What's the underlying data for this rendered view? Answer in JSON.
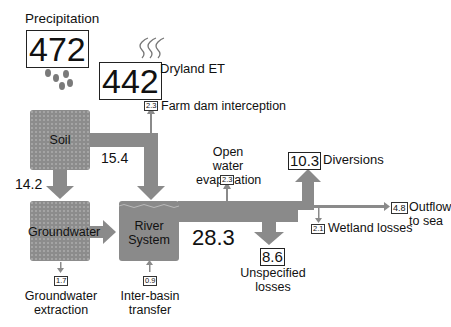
{
  "colors": {
    "flow": "#8a8a8a",
    "box": "#8c8c8c",
    "text": "#111111",
    "background": "#ffffff"
  },
  "inputs": {
    "precipitation": {
      "label": "Precipitation",
      "value": "472",
      "icon": "rain-drops-icon"
    },
    "dryland_et": {
      "label": "Dryland ET",
      "value": "442",
      "icon": "evaporation-waves-icon"
    }
  },
  "nodes": {
    "soil": {
      "label": "Soil"
    },
    "groundwater": {
      "label": "Groundwater"
    },
    "river_system": {
      "label_line1": "River",
      "label_line2": "System",
      "value": "28.3"
    }
  },
  "flows": {
    "soil_to_river": {
      "value": "15.4"
    },
    "soil_to_groundwater": {
      "value": "14.2"
    },
    "farm_dam_interception": {
      "label": "Farm dam interception",
      "value": "2.3"
    },
    "open_water_evaporation": {
      "label_line1": "Open water",
      "label_line2": "evaporation",
      "value": "2.3"
    },
    "diversions": {
      "label": "Diversions",
      "value": "10.3"
    },
    "outflow_to_sea": {
      "label": "Outflow to sea",
      "value": "4.8"
    },
    "wetland_losses": {
      "label": "Wetland losses",
      "value": "2.1"
    },
    "unspecified_losses": {
      "label_line1": "Unspecified",
      "label_line2": "losses",
      "value": "8.6"
    },
    "groundwater_extraction": {
      "label_line1": "Groundwater",
      "label_line2": "extraction",
      "value": "1.7"
    },
    "inter_basin_transfer": {
      "label_line1": "Inter-basin",
      "label_line2": "transfer",
      "value": "0.9"
    }
  }
}
